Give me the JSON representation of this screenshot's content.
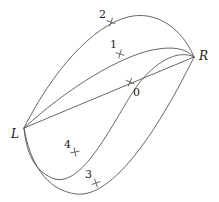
{
  "figure": {
    "width": 219,
    "height": 202,
    "background": "#ffffff",
    "stroke_color": "#555555",
    "label_color": "#1a1a1a"
  },
  "vertices": [
    {
      "id": "L",
      "label": "L",
      "label_x": 11,
      "label_y": 128,
      "point_x": 24,
      "point_y": 128
    },
    {
      "id": "R",
      "label": "R",
      "label_x": 199,
      "label_y": 50,
      "point_x": 194,
      "point_y": 57
    }
  ],
  "curves": [
    {
      "id": "curve-0",
      "label": "0",
      "label_x": 133,
      "label_y": 87,
      "tick_x": 130,
      "tick_y": 82,
      "tick_angle": -22,
      "path": "M 24 128 L 194 57"
    },
    {
      "id": "curve-1",
      "label": "1",
      "label_x": 110,
      "label_y": 39,
      "tick_x": 120,
      "tick_y": 54,
      "tick_angle": -28,
      "path": "M 24 128 C 70 86 120 57 152 50 C 172 46 186 48 194 57"
    },
    {
      "id": "curve-2",
      "label": "2",
      "label_x": 99,
      "label_y": 9,
      "tick_x": 111,
      "tick_y": 22,
      "tick_angle": -25,
      "path": "M 24 128 C 52 72 92 26 128 17 C 156 10 182 28 194 57"
    },
    {
      "id": "curve-3",
      "label": "3",
      "label_x": 85,
      "label_y": 169,
      "tick_x": 96,
      "tick_y": 183,
      "tick_angle": 25,
      "path": "M 24 128 C 30 163 46 190 76 194 C 118 199 168 110 194 57"
    },
    {
      "id": "curve-4",
      "label": "4",
      "label_x": 64,
      "label_y": 139,
      "tick_x": 75,
      "tick_y": 152,
      "tick_angle": -56,
      "path": "M 24 128 C 26 152 34 170 52 178 C 84 192 118 110 140 82 C 160 58 180 50 194 57"
    }
  ]
}
